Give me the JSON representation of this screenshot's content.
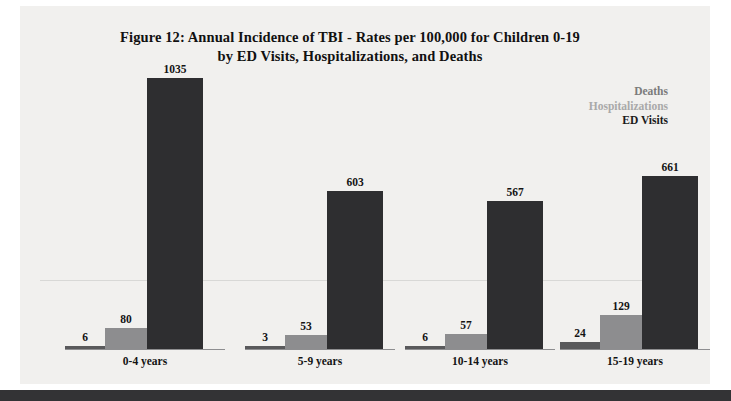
{
  "figure": {
    "title_line1": "Figure 12:  Annual Incidence of TBI - Rates per 100,000 for Children 0-19",
    "title_line2": "by ED Visits, Hospitalizations, and Deaths"
  },
  "legend": {
    "items": [
      {
        "label": "Deaths",
        "color": "#7b7b7b"
      },
      {
        "label": "Hospitalizations",
        "color": "#a9a9a9"
      },
      {
        "label": "ED Visits",
        "color": "#1b1b1b"
      }
    ]
  },
  "colors": {
    "page_background": "#ffffff",
    "panel_background": "#f1f0ee",
    "footer_bar": "#333335",
    "baseline": "#8e8e90",
    "deaths_bar": "#59595b",
    "hospitalizations_bar": "#8d8d8f",
    "ed_visits_bar": "#2e2e30",
    "label_text": "#141414"
  },
  "chart_data": {
    "type": "bar",
    "title": "Figure 12:  Annual Incidence of TBI - Rates per 100,000 for Children 0-19 by ED Visits, Hospitalizations, and Deaths",
    "xlabel": "",
    "ylabel": "",
    "ylim": [
      0,
      1100
    ],
    "grid": false,
    "legend_position": "top-right",
    "categories": [
      "0-4 years",
      "5-9 years",
      "10-14 years",
      "15-19 years"
    ],
    "series": [
      {
        "name": "Deaths",
        "values": [
          6,
          3,
          6,
          24
        ]
      },
      {
        "name": "Hospitalizations",
        "values": [
          80,
          53,
          57,
          129
        ]
      },
      {
        "name": "ED Visits",
        "values": [
          1035,
          603,
          567,
          661
        ]
      }
    ]
  }
}
